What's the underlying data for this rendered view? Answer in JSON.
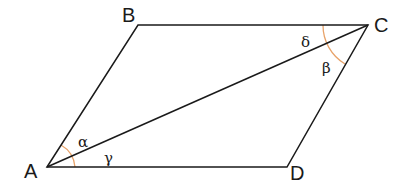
{
  "diagram": {
    "type": "parallelogram",
    "colors": {
      "stroke": "#1a1a1a",
      "arc": "#e8a36a",
      "background": "#ffffff"
    },
    "vertices": [
      {
        "id": "A",
        "label": "A",
        "x": 47,
        "y": 167
      },
      {
        "id": "B",
        "label": "B",
        "x": 138,
        "y": 25
      },
      {
        "id": "C",
        "label": "C",
        "x": 368,
        "y": 25
      },
      {
        "id": "D",
        "label": "D",
        "x": 287,
        "y": 167
      }
    ],
    "sides": [
      "AB",
      "BC",
      "CD",
      "DA"
    ],
    "diagonal": "AC",
    "angles": [
      {
        "label": "α",
        "vertex": "A",
        "between": [
          "AB",
          "AC"
        ]
      },
      {
        "label": "γ",
        "vertex": "A",
        "between": [
          "AC",
          "AD"
        ]
      },
      {
        "label": "δ",
        "vertex": "C",
        "between": [
          "CB",
          "CA"
        ]
      },
      {
        "label": "β",
        "vertex": "C",
        "between": [
          "CA",
          "CD"
        ]
      }
    ]
  }
}
